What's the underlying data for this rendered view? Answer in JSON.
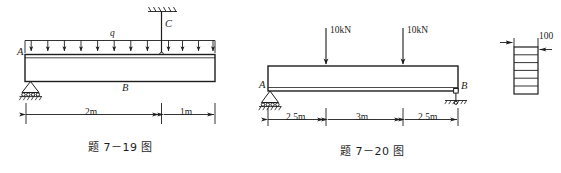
{
  "page": {
    "background_color": "#ffffff",
    "ink_color": "#1d1d1d",
    "width": 561,
    "height": 173
  },
  "figures": [
    {
      "id": "fig-7-19",
      "caption": "题 7－19 图",
      "type": "beam-diagram",
      "description": "Beam with uniformly distributed load q, roller support at A, hanger rod to fixed ceiling at C",
      "points": [
        {
          "name": "A",
          "label": "A"
        },
        {
          "name": "B",
          "label": "B"
        },
        {
          "name": "C",
          "label": "C"
        }
      ],
      "loads": [
        {
          "name": "distributed-load-q",
          "label": "q",
          "arrow_count": 12,
          "direction": "down"
        }
      ],
      "supports": [
        {
          "name": "roller-support-a",
          "at": "A",
          "kind": "roller-on-ground"
        },
        {
          "name": "hanger-support-c",
          "at": "C",
          "kind": "rod-to-fixed-ceiling"
        }
      ],
      "dimensions": [
        {
          "name": "dim-2m",
          "label": "2m"
        },
        {
          "name": "dim-1m",
          "label": "1m"
        }
      ]
    },
    {
      "id": "fig-7-20",
      "caption": "题 7－20 图",
      "type": "beam-diagram",
      "description": "Simply supported beam with two 10kN point loads; pin at A, roller at B",
      "points": [
        {
          "name": "A",
          "label": "A"
        },
        {
          "name": "B",
          "label": "B"
        }
      ],
      "loads": [
        {
          "name": "point-load-left",
          "label": "10kN",
          "direction": "down"
        },
        {
          "name": "point-load-right",
          "label": "10kN",
          "direction": "down"
        }
      ],
      "supports": [
        {
          "name": "pin-support-a",
          "at": "A",
          "kind": "pin-on-ground"
        },
        {
          "name": "roller-support-b",
          "at": "B",
          "kind": "roller-on-ground"
        }
      ],
      "dimensions": [
        {
          "name": "dim-left",
          "label": "2.5m"
        },
        {
          "name": "dim-middle",
          "label": "3m"
        },
        {
          "name": "dim-right",
          "label": "2.5m"
        }
      ]
    },
    {
      "id": "cross-section",
      "type": "cross-section",
      "description": "Built-up laminated rectangular cross-section with 6 glued layers",
      "layer_count": 6,
      "dimensions": [
        {
          "name": "dim-width-100",
          "label": "100"
        }
      ]
    }
  ]
}
